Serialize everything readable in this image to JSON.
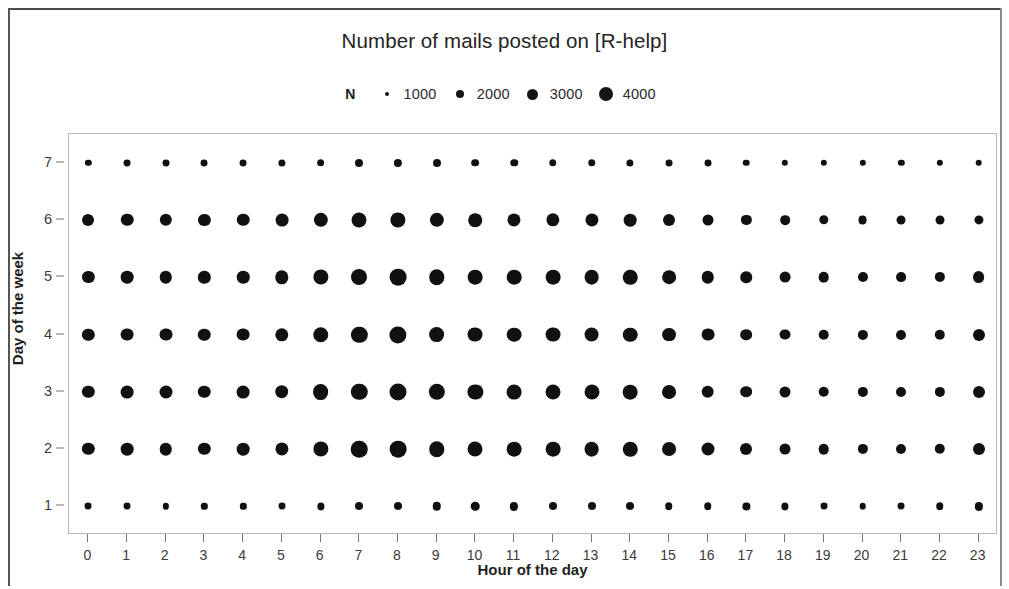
{
  "figure": {
    "title": "Number of mails posted on [R-help]",
    "xaxis_title": "Hour of the day",
    "yaxis_title": "Day of the week"
  },
  "legend": {
    "title": "N",
    "entries": [
      {
        "label": "1000",
        "value": 1000,
        "dot_px": 4
      },
      {
        "label": "2000",
        "value": 2000,
        "dot_px": 8
      },
      {
        "label": "3000",
        "value": 3000,
        "dot_px": 11
      },
      {
        "label": "4000",
        "value": 4000,
        "dot_px": 14
      }
    ]
  },
  "chart_data": {
    "type": "scatter",
    "subtype": "bubble-matrix",
    "title": "Number of mails posted on [R-help]",
    "xlabel": "Hour of the day",
    "ylabel": "Day of the week",
    "x": [
      0,
      1,
      2,
      3,
      4,
      5,
      6,
      7,
      8,
      9,
      10,
      11,
      12,
      13,
      14,
      15,
      16,
      17,
      18,
      19,
      20,
      21,
      22,
      23
    ],
    "y": [
      1,
      2,
      3,
      4,
      5,
      6,
      7
    ],
    "xlim": [
      -0.5,
      23.5
    ],
    "ylim": [
      0.5,
      7.5
    ],
    "grid": false,
    "legend_position": "top",
    "size_encodes": "N (number of mails)",
    "size_legend_values": [
      1000,
      2000,
      3000,
      4000
    ],
    "series": [
      {
        "name": "Day 1",
        "y": 1,
        "values": [
          600,
          600,
          500,
          500,
          500,
          600,
          650,
          800,
          800,
          900,
          900,
          850,
          800,
          800,
          800,
          700,
          700,
          650,
          650,
          600,
          550,
          600,
          700,
          850
        ]
      },
      {
        "name": "Day 2",
        "y": 2,
        "values": [
          1900,
          2000,
          1950,
          1900,
          2000,
          2150,
          2900,
          3400,
          3500,
          3000,
          2800,
          2700,
          2700,
          2700,
          2600,
          2400,
          2100,
          1800,
          1500,
          1400,
          1300,
          1250,
          1350,
          1800
        ]
      },
      {
        "name": "Day 3",
        "y": 3,
        "values": [
          1900,
          2050,
          2100,
          1950,
          2050,
          2300,
          3100,
          3350,
          3600,
          3300,
          2900,
          2750,
          2800,
          2800,
          2700,
          2400,
          2000,
          1700,
          1500,
          1400,
          1300,
          1250,
          1300,
          1800
        ]
      },
      {
        "name": "Day 4",
        "y": 4,
        "values": [
          1900,
          2050,
          2100,
          1950,
          2050,
          2250,
          3000,
          3300,
          3700,
          3100,
          2800,
          2700,
          2750,
          2750,
          2650,
          2400,
          2050,
          1700,
          1500,
          1400,
          1300,
          1250,
          1350,
          1800
        ]
      },
      {
        "name": "Day 5",
        "y": 5,
        "values": [
          1850,
          2000,
          1950,
          1900,
          1950,
          2250,
          2900,
          3200,
          3500,
          3000,
          2700,
          2650,
          2700,
          2700,
          2600,
          2350,
          1950,
          1650,
          1450,
          1400,
          1250,
          1200,
          1300,
          1750
        ]
      },
      {
        "name": "Day 6",
        "y": 6,
        "values": [
          1800,
          1950,
          1900,
          1850,
          1950,
          2050,
          2550,
          2800,
          2900,
          2550,
          2300,
          2150,
          2200,
          2150,
          2000,
          1800,
          1500,
          1300,
          1150,
          1100,
          1000,
          1000,
          1000,
          1050
        ]
      },
      {
        "name": "Day 7",
        "y": 7,
        "values": [
          500,
          600,
          600,
          600,
          600,
          650,
          750,
          800,
          850,
          800,
          750,
          700,
          700,
          700,
          650,
          600,
          600,
          550,
          500,
          500,
          500,
          500,
          500,
          550
        ]
      }
    ]
  }
}
